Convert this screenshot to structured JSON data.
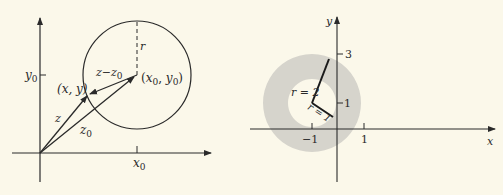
{
  "left_figure": {
    "axis_y_label": "y",
    "axis_y_sub": "0",
    "axis_x_label": "x",
    "axis_x_sub": "0",
    "point_label": "(x, y)",
    "center_label_x": "x",
    "center_label_y": "y",
    "center_sub": "0",
    "vector_z": "z",
    "vector_z0": "z",
    "vector_z0_sub": "0",
    "difference_label": "z−z",
    "difference_sub": "0",
    "radius_label": "r"
  },
  "right_figure": {
    "axis_x_label": "x",
    "axis_y_label": "y",
    "tick_x_neg1": "−1",
    "tick_x_1": "1",
    "tick_y_1": "1",
    "tick_y_3": "3",
    "outer_radius_label": "r = 2",
    "inner_radius_label": "r = 1",
    "annulus_color": "#d6d4cc"
  }
}
